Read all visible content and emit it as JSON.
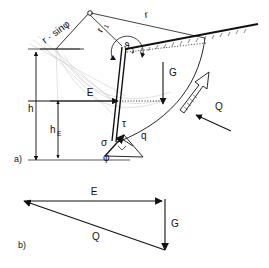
{
  "figure": {
    "background_color": "#ffffff",
    "line_color": "#111111",
    "construction_color": "#c9c9c9",
    "panels": [
      {
        "id": "a",
        "label": "a)",
        "caption": "Failure geometry and acting forces"
      },
      {
        "id": "b",
        "label": "b)",
        "caption": "Force triangle"
      }
    ]
  },
  "panel_a": {
    "label": "a)",
    "geometry_labels": [
      {
        "name": "r-sin-phi",
        "text": "r · sinφ",
        "rotation": -36
      },
      {
        "name": "r1",
        "text": "r",
        "subscript": "1",
        "rotation": -62
      },
      {
        "name": "r",
        "text": "r",
        "rotation": -8
      },
      {
        "name": "theta1",
        "text": "ϑ",
        "subscript": "1"
      }
    ],
    "dimensions": [
      {
        "name": "h",
        "text": "h"
      },
      {
        "name": "hE",
        "text": "h",
        "subscript": "E"
      }
    ],
    "forces": [
      {
        "name": "E",
        "text": "E",
        "direction": "right",
        "description": "earth pressure resultant"
      },
      {
        "name": "G",
        "text": "G",
        "direction": "down",
        "description": "self weight"
      },
      {
        "name": "Q",
        "text": "Q",
        "direction": "up-left",
        "description": "resultant on slip surface"
      }
    ],
    "stresses": [
      {
        "name": "tau",
        "text": "τ",
        "description": "shear stress"
      },
      {
        "name": "sigma",
        "text": "σ",
        "description": "normal stress"
      },
      {
        "name": "q",
        "text": "q",
        "description": "resultant stress"
      },
      {
        "name": "phi",
        "text": "φ",
        "description": "friction angle"
      }
    ],
    "center_marker": {
      "name": "spiral-center",
      "shape": "small-circle"
    },
    "rotation_arrow": {
      "name": "rotation-arrow",
      "style": "hollow-outline",
      "direction": "counterclockwise"
    }
  },
  "panel_b": {
    "label": "b)",
    "vectors": [
      {
        "name": "E",
        "text": "E",
        "direction": "right"
      },
      {
        "name": "G",
        "text": "G",
        "direction": "down"
      },
      {
        "name": "Q",
        "text": "Q",
        "direction": "up-left"
      }
    ]
  }
}
